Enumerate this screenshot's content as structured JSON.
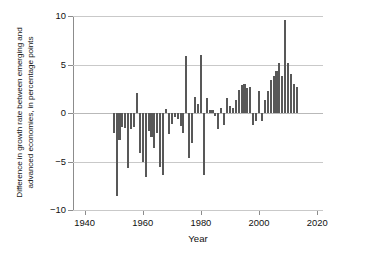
{
  "chart_data": {
    "type": "bar",
    "title": "",
    "xlabel": "Year",
    "ylabel": "Difference in growth rate between emerging and advanced economies, in percentage points",
    "ylabel_line1": "Difference in growth rate between emerging and",
    "ylabel_line2": "advanced economies, in percentage points",
    "xlim": [
      1936,
      2022
    ],
    "ylim": [
      -10,
      10
    ],
    "xticks": [
      1940,
      1960,
      1980,
      2000,
      2020
    ],
    "xticklabels": [
      "1940",
      "1960",
      "1980",
      "2000",
      "2020"
    ],
    "yticks": [
      10,
      5,
      0,
      -5,
      -10
    ],
    "yticklabels": [
      "10",
      "5",
      "0",
      "−5",
      "−10"
    ],
    "grid": "horizontal",
    "legend": "none",
    "bar_color": "#585858",
    "axis_color": "#8c8c8c",
    "grid_color": "#c9c9c9",
    "x": [
      1950,
      1951,
      1952,
      1953,
      1954,
      1955,
      1956,
      1957,
      1958,
      1959,
      1960,
      1961,
      1962,
      1963,
      1964,
      1965,
      1966,
      1967,
      1968,
      1969,
      1970,
      1971,
      1972,
      1973,
      1974,
      1975,
      1976,
      1977,
      1978,
      1979,
      1980,
      1981,
      1982,
      1983,
      1984,
      1985,
      1986,
      1987,
      1988,
      1989,
      1990,
      1991,
      1992,
      1993,
      1994,
      1995,
      1996,
      1997,
      1998,
      1999,
      2000,
      2001,
      2002,
      2003,
      2004,
      2005,
      2006,
      2007,
      2008,
      2009,
      2010,
      2011,
      2012,
      2013
    ],
    "values": [
      -2.1,
      -8.6,
      -2.8,
      -1.4,
      -1.5,
      -5.7,
      -1.6,
      -1.4,
      2.1,
      -4.1,
      -5.1,
      -6.6,
      -1.9,
      -2.5,
      -3.6,
      -2.1,
      -5.6,
      -6.4,
      0.4,
      -2.2,
      -1.1,
      -0.4,
      -0.6,
      -1.3,
      -2.1,
      5.9,
      -4.6,
      -3.1,
      1.7,
      0.9,
      6.0,
      -6.4,
      1.5,
      0.3,
      0.3,
      -0.3,
      -1.7,
      0.5,
      -1.2,
      1.5,
      0.7,
      0.5,
      1.3,
      2.4,
      2.9,
      3.0,
      2.6,
      2.7,
      -1.2,
      -0.8,
      2.3,
      -0.8,
      1.3,
      2.3,
      3.4,
      3.8,
      4.3,
      5.2,
      3.8,
      9.6,
      5.2,
      4.0,
      3.0,
      2.7
    ],
    "notable_points": [
      {
        "year": 1951,
        "value": -8.6,
        "note": "minimum"
      },
      {
        "year": 2009,
        "value": 9.6,
        "note": "maximum"
      },
      {
        "year": 1980,
        "value": 6.0
      },
      {
        "year": 1975,
        "value": 5.9
      },
      {
        "year": 1981,
        "value": -6.4
      },
      {
        "year": 1967,
        "value": -6.4
      },
      {
        "year": 1961,
        "value": -6.6
      }
    ]
  }
}
